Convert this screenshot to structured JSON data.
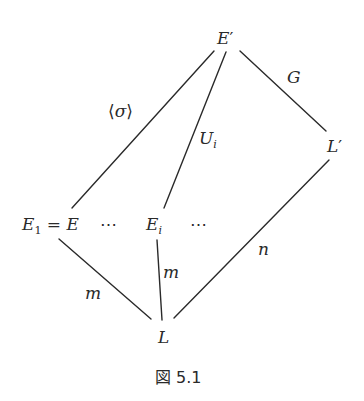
{
  "diagram": {
    "nodes": {
      "top": {
        "base": "E",
        "prime": "′"
      },
      "right": {
        "base": "L",
        "prime": "′"
      },
      "left": {
        "base": "E",
        "sub": "1",
        "eq": "=",
        "rhs": "E"
      },
      "left_dots": "⋯",
      "mid": {
        "base": "E",
        "sub": "i"
      },
      "mid_dots": "⋯",
      "bottom": {
        "base": "L"
      }
    },
    "edges": {
      "top_left": {
        "label_open": "⟨",
        "label_mid": "σ",
        "label_close": "⟩"
      },
      "top_mid": {
        "base": "U",
        "sub": "i"
      },
      "top_right": {
        "label": "G"
      },
      "left_bottom": {
        "label": "m"
      },
      "mid_bottom": {
        "label": "m"
      },
      "right_bottom": {
        "label": "n"
      }
    },
    "caption": "図 5.1",
    "line_color": "#2a2a2a"
  }
}
